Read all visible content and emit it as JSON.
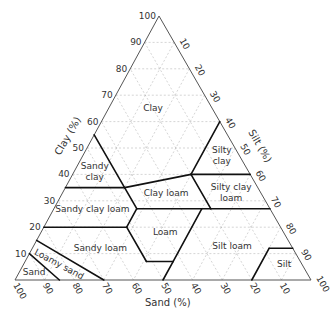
{
  "chart_data": {
    "type": "ternary",
    "title": "",
    "axes": {
      "sand": {
        "label": "Sand (%)",
        "ticks": [
          100,
          90,
          80,
          70,
          60,
          50,
          40,
          30,
          20,
          10
        ]
      },
      "clay": {
        "label": "Clay (%)",
        "ticks": [
          10,
          20,
          30,
          40,
          50,
          60,
          70,
          80,
          90,
          100
        ]
      },
      "silt": {
        "label": "Silt (%)",
        "ticks": [
          10,
          20,
          30,
          40,
          50,
          60,
          70,
          80,
          90,
          100
        ]
      }
    },
    "grid": true,
    "regions": [
      {
        "name": "Clay",
        "label_lines": [
          "Clay"
        ],
        "label_at": {
          "sand": 20,
          "clay": 65
        }
      },
      {
        "name": "Sandy clay",
        "label_lines": [
          "Sandy",
          "clay"
        ],
        "label_at": {
          "sand": 52,
          "clay": 41
        }
      },
      {
        "name": "Silty clay",
        "label_lines": [
          "Silty",
          "clay"
        ],
        "label_at": {
          "sand": 6,
          "clay": 47
        }
      },
      {
        "name": "Clay loam",
        "label_lines": [
          "Clay loam"
        ],
        "label_at": {
          "sand": 32,
          "clay": 33
        }
      },
      {
        "name": "Silty clay loam",
        "label_lines": [
          "Silty clay",
          "loam"
        ],
        "label_at": {
          "sand": 10,
          "clay": 33
        }
      },
      {
        "name": "Sandy clay loam",
        "label_lines": [
          "Sandy clay loam"
        ],
        "label_at": {
          "sand": 60,
          "clay": 27
        }
      },
      {
        "name": "Loam",
        "label_lines": [
          "Loam"
        ],
        "label_at": {
          "sand": 40,
          "clay": 18
        }
      },
      {
        "name": "Silt loam",
        "label_lines": [
          "Silt loam"
        ],
        "label_at": {
          "sand": 20,
          "clay": 13
        }
      },
      {
        "name": "Sandy loam",
        "label_lines": [
          "Sandy loam"
        ],
        "label_at": {
          "sand": 65,
          "clay": 12
        }
      },
      {
        "name": "Silt",
        "label_lines": [
          "Silt"
        ],
        "label_at": {
          "sand": 6,
          "clay": 6
        }
      },
      {
        "name": "Loamy sand",
        "label_lines": [
          "Loamy sand"
        ],
        "label_at": {
          "sand": 82,
          "clay": 6
        }
      },
      {
        "name": "Sand",
        "label_lines": [
          "Sand"
        ],
        "label_at": {
          "sand": 92,
          "clay": 3
        }
      }
    ],
    "boundaries": [
      [
        [
          45,
          55
        ],
        [
          45,
          35
        ]
      ],
      [
        [
          65,
          35
        ],
        [
          45,
          35
        ]
      ],
      [
        [
          45,
          35
        ],
        [
          20,
          40
        ]
      ],
      [
        [
          20,
          40
        ],
        [
          0,
          40
        ]
      ],
      [
        [
          20,
          40
        ],
        [
          0,
          60
        ]
      ],
      [
        [
          20,
          40
        ],
        [
          20,
          27
        ]
      ],
      [
        [
          45,
          27
        ],
        [
          20,
          27
        ]
      ],
      [
        [
          20,
          27
        ],
        [
          0,
          27
        ]
      ],
      [
        [
          45,
          35
        ],
        [
          45,
          27
        ]
      ],
      [
        [
          45,
          27
        ],
        [
          52,
          20
        ]
      ],
      [
        [
          80,
          20
        ],
        [
          52,
          20
        ]
      ],
      [
        [
          52,
          20
        ],
        [
          52,
          7
        ]
      ],
      [
        [
          52,
          7
        ],
        [
          43,
          7
        ]
      ],
      [
        [
          43,
          7
        ],
        [
          23,
          27
        ]
      ],
      [
        [
          43,
          7
        ],
        [
          50,
          0
        ]
      ],
      [
        [
          85,
          15
        ],
        [
          70,
          0
        ]
      ],
      [
        [
          90,
          10
        ],
        [
          85,
          0
        ]
      ],
      [
        [
          20,
          0
        ],
        [
          8,
          12
        ]
      ],
      [
        [
          8,
          12
        ],
        [
          0,
          12
        ]
      ]
    ]
  }
}
